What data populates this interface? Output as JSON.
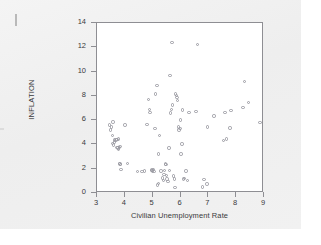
{
  "chart_data": {
    "type": "scatter",
    "title": "",
    "xlabel": "Civilian Unemployment Rate",
    "ylabel": "INFLATION",
    "xlim": [
      3,
      9
    ],
    "ylim": [
      0,
      14
    ],
    "xticks": [
      3,
      4,
      5,
      6,
      7,
      8,
      9
    ],
    "yticks": [
      0,
      2,
      4,
      6,
      8,
      10,
      12,
      14
    ],
    "grid": false,
    "legend": null,
    "marker": "open-circle",
    "marker_color": "#9a9aa2",
    "frame_color": "#8e8e93",
    "plot_background": "#ffffff",
    "page_background": "#f0f0f0",
    "points": [
      [
        3.45,
        5.6
      ],
      [
        3.48,
        5.2
      ],
      [
        3.52,
        5.45
      ],
      [
        3.55,
        4.75
      ],
      [
        3.58,
        5.85
      ],
      [
        3.62,
        4.35
      ],
      [
        3.55,
        4.1
      ],
      [
        3.6,
        3.95
      ],
      [
        3.62,
        4.2
      ],
      [
        3.68,
        4.35
      ],
      [
        3.72,
        3.75
      ],
      [
        3.75,
        3.7
      ],
      [
        3.78,
        3.6
      ],
      [
        3.8,
        3.75
      ],
      [
        3.82,
        3.85
      ],
      [
        3.72,
        4.4
      ],
      [
        3.78,
        4.45
      ],
      [
        3.8,
        2.45
      ],
      [
        3.82,
        2.4
      ],
      [
        3.84,
        2.35
      ],
      [
        3.86,
        1.95
      ],
      [
        4.0,
        5.6
      ],
      [
        4.1,
        2.45
      ],
      [
        4.45,
        1.75
      ],
      [
        4.62,
        1.75
      ],
      [
        4.7,
        1.8
      ],
      [
        4.8,
        5.65
      ],
      [
        4.85,
        7.7
      ],
      [
        4.88,
        6.9
      ],
      [
        4.9,
        6.65
      ],
      [
        4.95,
        1.85
      ],
      [
        4.98,
        1.9
      ],
      [
        5.0,
        1.8
      ],
      [
        5.02,
        1.95
      ],
      [
        5.05,
        1.75
      ],
      [
        5.08,
        5.3
      ],
      [
        5.1,
        8.15
      ],
      [
        5.15,
        8.85
      ],
      [
        5.18,
        0.65
      ],
      [
        5.2,
        0.8
      ],
      [
        5.22,
        3.2
      ],
      [
        5.25,
        4.75
      ],
      [
        5.3,
        1.8
      ],
      [
        5.35,
        1.25
      ],
      [
        5.38,
        1.05
      ],
      [
        5.4,
        1.5
      ],
      [
        5.42,
        1.85
      ],
      [
        5.45,
        2.4
      ],
      [
        5.48,
        2.35
      ],
      [
        5.5,
        1.45
      ],
      [
        5.52,
        1.15
      ],
      [
        5.55,
        0.95
      ],
      [
        5.58,
        3.7
      ],
      [
        5.6,
        1.85
      ],
      [
        5.62,
        9.7
      ],
      [
        5.65,
        6.6
      ],
      [
        5.68,
        6.9
      ],
      [
        5.7,
        12.4
      ],
      [
        5.72,
        7.25
      ],
      [
        5.75,
        1.4
      ],
      [
        5.78,
        1.15
      ],
      [
        5.8,
        0.45
      ],
      [
        5.82,
        8.15
      ],
      [
        5.85,
        8.05
      ],
      [
        5.88,
        7.85
      ],
      [
        5.9,
        7.6
      ],
      [
        5.92,
        5.45
      ],
      [
        5.95,
        5.2
      ],
      [
        5.98,
        5.3
      ],
      [
        6.0,
        6.0
      ],
      [
        6.02,
        3.2
      ],
      [
        6.05,
        4.05
      ],
      [
        6.08,
        6.85
      ],
      [
        6.1,
        1.15
      ],
      [
        6.15,
        1.2
      ],
      [
        6.2,
        1.8
      ],
      [
        6.25,
        1.05
      ],
      [
        6.3,
        6.65
      ],
      [
        6.55,
        6.7
      ],
      [
        6.6,
        12.25
      ],
      [
        6.8,
        0.5
      ],
      [
        6.85,
        1.1
      ],
      [
        6.95,
        0.75
      ],
      [
        6.98,
        5.45
      ],
      [
        7.2,
        6.35
      ],
      [
        7.55,
        4.3
      ],
      [
        7.6,
        6.65
      ],
      [
        7.65,
        4.45
      ],
      [
        7.78,
        5.35
      ],
      [
        7.82,
        6.8
      ],
      [
        8.25,
        7.05
      ],
      [
        8.3,
        9.2
      ],
      [
        8.45,
        7.45
      ],
      [
        8.85,
        5.8
      ]
    ]
  }
}
